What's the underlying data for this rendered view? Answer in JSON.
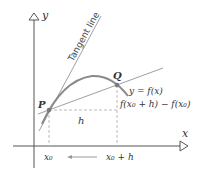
{
  "diagram": {
    "axes": {
      "x_label": "x",
      "y_label": "y"
    },
    "points": {
      "P": {
        "label": "P"
      },
      "Q": {
        "label": "Q"
      }
    },
    "labels": {
      "tangent_line": "Tangent line",
      "curve": "y = f(x)",
      "rise": "f(x₀ + h) − f(x₀)",
      "run": "h",
      "x0": "x₀",
      "x0_plus_h": "x₀ + h"
    },
    "colors": {
      "axis": "#555555",
      "curve": "#8a8a8a",
      "lines": "#a0a0a0",
      "dashed": "#bbbbbb",
      "text": "#333333"
    }
  }
}
